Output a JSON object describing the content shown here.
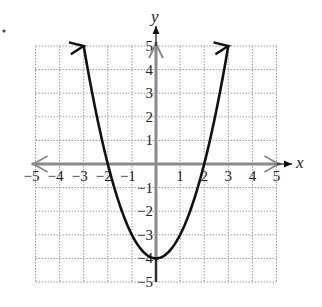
{
  "chart_data": {
    "type": "line",
    "title": "",
    "function": "y = x^2 - 4",
    "xlabel": "x",
    "ylabel": "y",
    "xlim": [
      -5,
      5
    ],
    "ylim": [
      -5,
      5
    ],
    "grid": true,
    "grid_style": "dotted",
    "x_ticks": [
      "-5",
      "-4",
      "-3",
      "-2",
      "-1",
      "1",
      "2",
      "3",
      "4",
      "5"
    ],
    "y_ticks": [
      "5",
      "4",
      "3",
      "2",
      "1",
      "-1",
      "-2",
      "-3",
      "-4",
      "-5"
    ],
    "series": [
      {
        "name": "parabola",
        "x": [
          -3,
          -2.5,
          -2,
          -1.5,
          -1,
          -0.5,
          0,
          0.5,
          1,
          1.5,
          2,
          2.5,
          3
        ],
        "y": [
          5,
          2.25,
          0,
          -1.75,
          -3,
          -3.75,
          -4,
          -3.75,
          -3,
          -1.75,
          0,
          2.25,
          5
        ],
        "color": "#111111",
        "arrows_at_ends": true
      }
    ],
    "annotations": {
      "vertex": [
        0,
        -4
      ],
      "x_intercepts": [
        -2,
        2
      ]
    }
  },
  "colors": {
    "curve": "#111111",
    "axis": "#8a8a8a",
    "grid": "#9a9a9a",
    "text": "#222222"
  },
  "labels": {
    "x_axis": "x",
    "y_axis": "y"
  }
}
